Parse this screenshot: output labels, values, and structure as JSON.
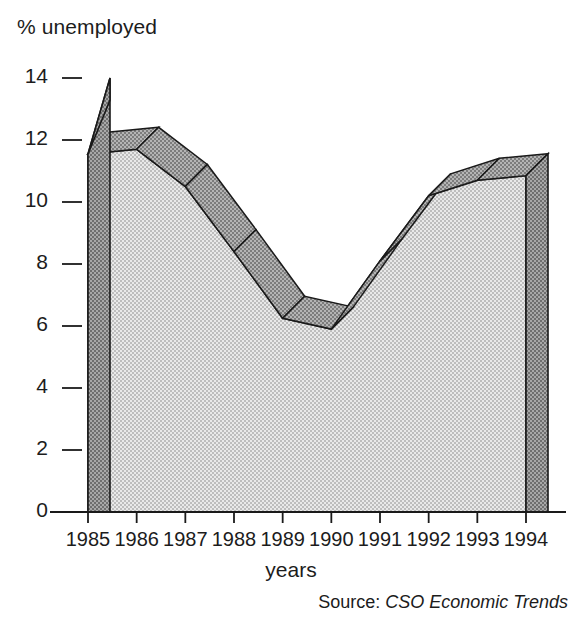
{
  "chart_data": {
    "type": "area",
    "title": "",
    "ylabel": "% unemployed",
    "xlabel": "years",
    "source": "Source:",
    "source_publication": "CSO Economic Trends",
    "categories": [
      "1985",
      "1986",
      "1987",
      "1988",
      "1989",
      "1990",
      "1991",
      "1992",
      "1993",
      "1994"
    ],
    "values": [
      11.55,
      11.7,
      10.5,
      8.4,
      6.25,
      5.9,
      8.1,
      10.2,
      10.7,
      10.85
    ],
    "series": [
      {
        "name": "% unemployed",
        "values": [
          11.55,
          11.7,
          10.5,
          8.4,
          6.25,
          5.9,
          8.1,
          10.2,
          10.7,
          10.85
        ]
      }
    ],
    "ylim": [
      0,
      14
    ],
    "yticks": [
      0,
      2,
      4,
      6,
      8,
      10,
      12,
      14
    ],
    "ytick_labels": [
      "0",
      "2",
      "4",
      "6",
      "8",
      "10",
      "12",
      "14"
    ],
    "xtick_labels": [
      "1985",
      "1986",
      "1987",
      "1988",
      "1989",
      "1990",
      "1991",
      "1992",
      "1993",
      "1994"
    ],
    "grid": false,
    "legend": false,
    "style": "3d-extruded-area",
    "colors": {
      "front_face": "#d2d2d2",
      "top_face": "#9d9d9d",
      "side_face": "#9d9d9d",
      "outline": "#1a1a1a",
      "axis": "#1a1a1a",
      "text": "#1c1c1c",
      "background": "#ffffff"
    },
    "annotations": []
  },
  "axes": {
    "y_axis_name": "y-axis",
    "x_axis_name": "x-axis"
  }
}
